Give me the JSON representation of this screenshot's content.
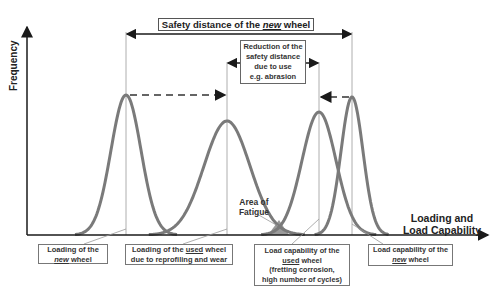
{
  "diagram": {
    "title_box": {
      "pre": "Safety distance of the ",
      "em": "new",
      "post": " wheel"
    },
    "reduction_box": {
      "lines": [
        "Reduction of the",
        "safety distance",
        "due to use",
        "e.g. abrasion"
      ]
    },
    "y_axis_label": "Frequency",
    "x_axis_label": [
      "Loading and",
      "Load Capability"
    ],
    "fatigue_label": [
      "Area of",
      "Fatigue"
    ],
    "labels": {
      "loading_new": {
        "line1": "Loading of the",
        "em": "new",
        "line2_post": " wheel"
      },
      "loading_used": {
        "pre": "Loading of the ",
        "em": "used",
        "post": " wheel",
        "line2": "due to reprofiling and wear"
      },
      "capability_used": {
        "line1": "Load capability of the",
        "em": "used",
        "line2_post": " wheel",
        "line3": "(fretting corrosion,",
        "line4": "high number of cycles)"
      },
      "capability_new": {
        "line1": "Load capability  of the",
        "em": "new",
        "line2_post": " wheel"
      }
    },
    "curves": [
      {
        "name": "loading-new",
        "peak_x": 126,
        "peak_y": 95,
        "sigma": 15
      },
      {
        "name": "loading-used",
        "peak_x": 227,
        "peak_y": 121,
        "sigma": 23
      },
      {
        "name": "capability-used",
        "peak_x": 319,
        "peak_y": 112,
        "sigma": 17
      },
      {
        "name": "capability-new",
        "peak_x": 352,
        "peak_y": 97,
        "sigma": 11
      }
    ],
    "colors": {
      "curve": "#7a7a7a",
      "axis": "#1a1a1a",
      "fatigue_fill": "#9a9a9a",
      "guide": "#999999"
    }
  }
}
